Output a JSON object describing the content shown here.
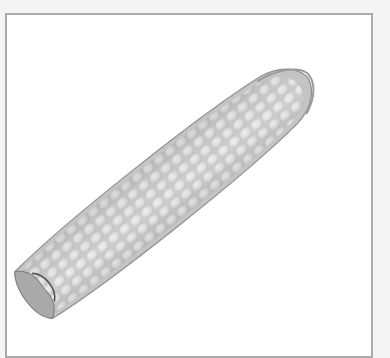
{
  "image": {
    "subject": "corn cob",
    "colors": {
      "page_background": "#f4f4f4",
      "frame_background": "#ffffff",
      "frame_border": "#ababab",
      "kernel_light": "#f2f2f2",
      "kernel_mid": "#d6d6d6",
      "kernel_shadow": "#9c9c9c",
      "husk": "#bdbdbd"
    }
  }
}
